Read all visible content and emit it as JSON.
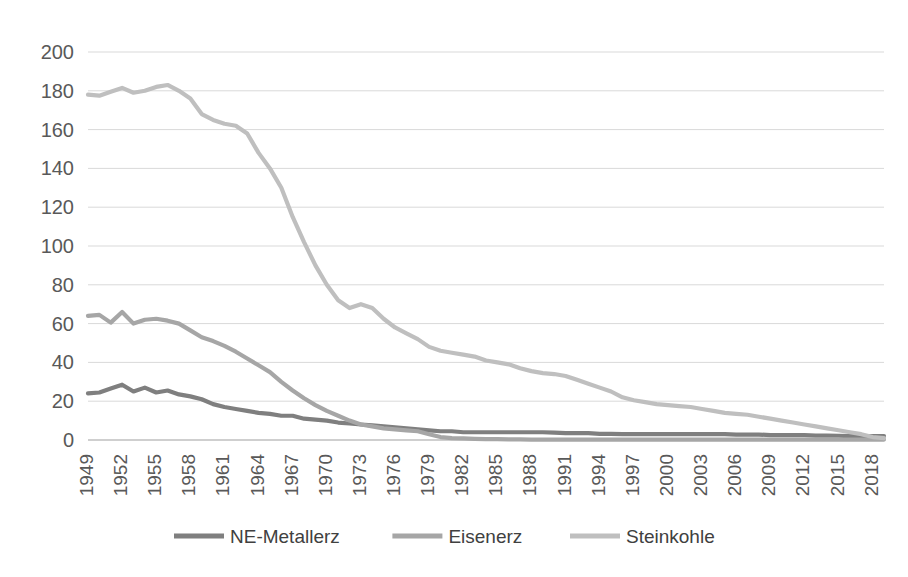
{
  "chart_data": {
    "type": "line",
    "title": "",
    "subtitle": "",
    "xlabel": "",
    "ylabel": "",
    "ylim": [
      0,
      200
    ],
    "ytick_step": 20,
    "yticks": [
      "0",
      "20",
      "40",
      "60",
      "80",
      "100",
      "120",
      "140",
      "160",
      "180",
      "200"
    ],
    "grid": true,
    "legend_position": "bottom",
    "x_start": 1949,
    "x_end": 2019,
    "xtick_step": 3,
    "xticks": [
      "1949",
      "1952",
      "1955",
      "1958",
      "1961",
      "1964",
      "1967",
      "1970",
      "1973",
      "1976",
      "1979",
      "1982",
      "1985",
      "1988",
      "1991",
      "1994",
      "1997",
      "2000",
      "2003",
      "2006",
      "2009",
      "2012",
      "2015",
      "2018"
    ],
    "x": [
      1949,
      1950,
      1951,
      1952,
      1953,
      1954,
      1955,
      1956,
      1957,
      1958,
      1959,
      1960,
      1961,
      1962,
      1963,
      1964,
      1965,
      1966,
      1967,
      1968,
      1969,
      1970,
      1971,
      1972,
      1973,
      1974,
      1975,
      1976,
      1977,
      1978,
      1979,
      1980,
      1981,
      1982,
      1983,
      1984,
      1985,
      1986,
      1987,
      1988,
      1989,
      1990,
      1991,
      1992,
      1993,
      1994,
      1995,
      1996,
      1997,
      1998,
      1999,
      2000,
      2001,
      2002,
      2003,
      2004,
      2005,
      2006,
      2007,
      2008,
      2009,
      2010,
      2011,
      2012,
      2013,
      2014,
      2015,
      2016,
      2017,
      2018,
      2019
    ],
    "series": [
      {
        "name": "NE-Metallerz",
        "color": "#7f7f7f",
        "width": 4.2,
        "values": [
          24.0,
          24.5,
          26.5,
          28.5,
          25.0,
          27.0,
          24.5,
          25.5,
          23.5,
          22.5,
          21.0,
          18.5,
          17.0,
          16.0,
          15.0,
          14.0,
          13.5,
          12.5,
          12.5,
          11.0,
          10.5,
          10.0,
          9.0,
          8.5,
          8.0,
          7.5,
          7.0,
          6.5,
          6.0,
          5.5,
          5.0,
          4.5,
          4.5,
          4.0,
          4.0,
          4.0,
          4.0,
          4.0,
          4.0,
          4.0,
          4.0,
          3.8,
          3.5,
          3.5,
          3.5,
          3.2,
          3.2,
          3.0,
          3.0,
          3.0,
          3.0,
          3.0,
          3.0,
          3.0,
          3.0,
          3.0,
          3.0,
          2.8,
          2.8,
          2.8,
          2.5,
          2.5,
          2.5,
          2.5,
          2.3,
          2.3,
          2.2,
          2.0,
          2.0,
          2.0,
          2.0
        ]
      },
      {
        "name": "Eisenerz",
        "color": "#a6a6a6",
        "width": 4.2,
        "values": [
          64.0,
          64.5,
          60.5,
          66.0,
          60.0,
          62.0,
          62.5,
          61.5,
          60.0,
          56.5,
          53.0,
          51.0,
          48.5,
          45.5,
          42.0,
          38.5,
          35.0,
          30.0,
          25.5,
          21.5,
          18.0,
          15.0,
          12.5,
          10.0,
          8.0,
          7.0,
          6.0,
          5.5,
          5.0,
          4.5,
          3.0,
          1.5,
          1.0,
          0.8,
          0.6,
          0.5,
          0.4,
          0.3,
          0.3,
          0.2,
          0.2,
          0.2,
          0.2,
          0.2,
          0.2,
          0.2,
          0.2,
          0.2,
          0.2,
          0.2,
          0.2,
          0.2,
          0.2,
          0.2,
          0.2,
          0.2,
          0.2,
          0.2,
          0.2,
          0.2,
          0.2,
          0.2,
          0.2,
          0.2,
          0.2,
          0.2,
          0.2,
          0.2,
          0.2,
          0.2,
          0.2
        ]
      },
      {
        "name": "Steinkohle",
        "color": "#bfbfbf",
        "width": 4.2,
        "values": [
          178.0,
          177.5,
          179.5,
          181.5,
          179.0,
          180.0,
          182.0,
          183.0,
          180.0,
          176.0,
          168.0,
          165.0,
          163.0,
          162.0,
          158.0,
          148.0,
          140.0,
          130.0,
          115.0,
          102.0,
          90.0,
          80.0,
          72.0,
          68.0,
          70.0,
          68.0,
          62.5,
          58.0,
          55.0,
          52.0,
          48.0,
          46.0,
          45.0,
          44.0,
          43.0,
          41.0,
          40.0,
          39.0,
          37.0,
          35.5,
          34.5,
          34.0,
          33.0,
          31.0,
          29.0,
          27.0,
          25.0,
          22.0,
          20.5,
          19.5,
          18.5,
          18.0,
          17.5,
          17.0,
          16.0,
          15.0,
          14.0,
          13.5,
          13.0,
          12.0,
          11.0,
          10.0,
          9.0,
          8.0,
          7.0,
          6.0,
          5.0,
          4.0,
          3.0,
          1.5,
          1.0
        ]
      }
    ]
  }
}
